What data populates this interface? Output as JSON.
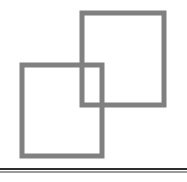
{
  "page": {
    "background_color": "#ffffff",
    "width": 187,
    "height": 182
  },
  "logo": {
    "name": "two-overlapping-squares",
    "description": "Two outlined squares in gray that overlap at their corners, above a horizontal rule",
    "stroke_color": "#808080",
    "stroke_width": 5,
    "fill_color": "none",
    "shapes": [
      {
        "name": "upper-right-square",
        "x": 82,
        "y": 13,
        "width": 82,
        "height": 92
      },
      {
        "name": "lower-left-square",
        "x": 22,
        "y": 65,
        "width": 80,
        "height": 91
      }
    ],
    "overlap_region": {
      "name": "overlap-rectangle",
      "x": 82,
      "y": 65,
      "width": 20,
      "height": 40
    }
  },
  "divider": {
    "name": "horizontal-rule",
    "dark_color": "#2e2e2e",
    "light_color": "#9b9b9b",
    "dark_y": 168,
    "light_y": 171,
    "thickness": 2
  }
}
